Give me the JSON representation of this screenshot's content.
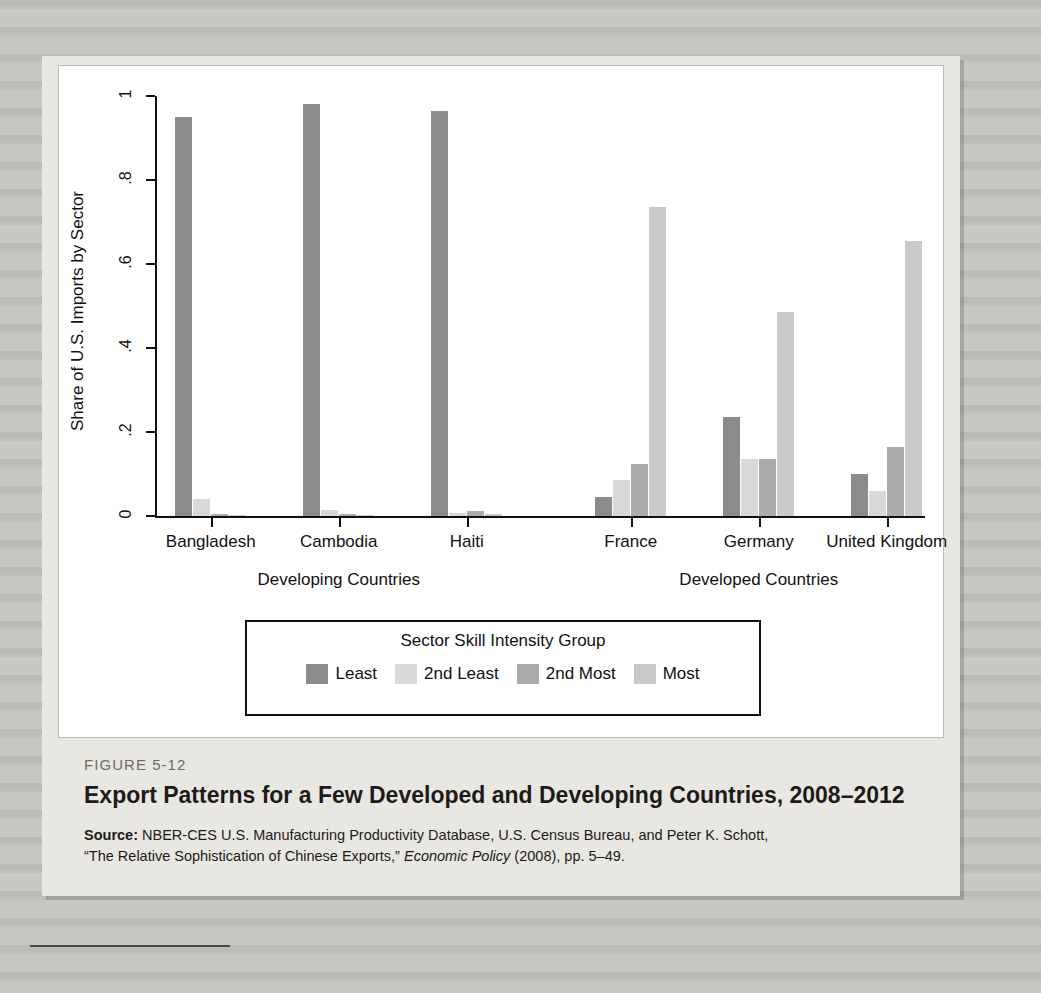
{
  "figure": {
    "number_label": "FIGURE 5-12",
    "title": "Export Patterns for a Few Developed and Developing Countries, 2008–2012",
    "source_label": "Source:",
    "source_text_1": " NBER-CES U.S. Manufacturing Productivity Database, U.S. Census Bureau, and Peter K. Schott,",
    "source_text_2a": "“The Relative Sophistication of Chinese Exports,” ",
    "source_text_2b": "Economic Policy",
    "source_text_2c": " (2008), pp. 5–49."
  },
  "legend": {
    "title": "Sector Skill Intensity Group",
    "items": [
      {
        "label": "Least",
        "color": "#8c8c8c"
      },
      {
        "label": "2nd Least",
        "color": "#d9d9d9"
      },
      {
        "label": "2nd Most",
        "color": "#ababab"
      },
      {
        "label": "Most",
        "color": "#c9c9c9"
      }
    ]
  },
  "chart_data": {
    "type": "bar",
    "title": "Export Patterns for a Few Developed and Developing Countries, 2008–2012",
    "xlabel": "",
    "ylabel": "Share of U.S. Imports by Sector",
    "ylim": [
      0,
      1
    ],
    "yticks": [
      0,
      0.2,
      0.4,
      0.6,
      0.8,
      1
    ],
    "ytick_labels": [
      "0",
      ".2",
      ".4",
      ".6",
      ".8",
      "1"
    ],
    "grid": false,
    "legend_position": "below-axes",
    "categories": [
      "Bangladesh",
      "Cambodia",
      "Haiti",
      "France",
      "Germany",
      "United Kingdom"
    ],
    "group_labels": [
      {
        "label": "Developing Countries",
        "categories": [
          "Bangladesh",
          "Cambodia",
          "Haiti"
        ]
      },
      {
        "label": "Developed Countries",
        "categories": [
          "France",
          "Germany",
          "United Kingdom"
        ]
      }
    ],
    "series": [
      {
        "name": "Least",
        "color": "#8c8c8c",
        "values": [
          0.95,
          0.98,
          0.965,
          0.045,
          0.235,
          0.1
        ]
      },
      {
        "name": "2nd Least",
        "color": "#d9d9d9",
        "values": [
          0.04,
          0.015,
          0.008,
          0.085,
          0.135,
          0.06
        ]
      },
      {
        "name": "2nd Most",
        "color": "#ababab",
        "values": [
          0.005,
          0.004,
          0.012,
          0.125,
          0.135,
          0.165
        ]
      },
      {
        "name": "Most",
        "color": "#c9c9c9",
        "values": [
          0.003,
          0.002,
          0.004,
          0.735,
          0.485,
          0.655
        ]
      }
    ]
  }
}
